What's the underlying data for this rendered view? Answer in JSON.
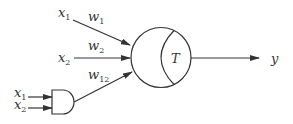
{
  "diagram": {
    "type": "higher-order neuron",
    "inputs": [
      {
        "id": "x1_top",
        "name": "x",
        "sub": "1"
      },
      {
        "id": "x2_mid",
        "name": "x",
        "sub": "2"
      },
      {
        "id": "x1_gate",
        "name": "x",
        "sub": "1"
      },
      {
        "id": "x2_gate",
        "name": "x",
        "sub": "2"
      }
    ],
    "weights": [
      {
        "name": "w",
        "sub": "1"
      },
      {
        "name": "w",
        "sub": "2"
      },
      {
        "name": "w",
        "sub": "12"
      }
    ],
    "neuron": {
      "threshold_label": "T"
    },
    "gate": {
      "type": "AND"
    },
    "output": {
      "label": "y"
    },
    "colors": {
      "stroke": "#333333",
      "background": "#ffffff"
    }
  }
}
